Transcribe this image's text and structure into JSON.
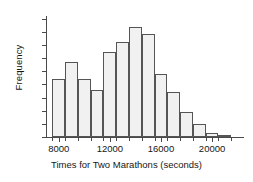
{
  "chart_data": {
    "type": "bar",
    "title": "",
    "xlabel": "Times for Two Marathons (seconds)",
    "ylabel": "Frequency",
    "xlim": [
      7000,
      22500
    ],
    "ylim": [
      0,
      92
    ],
    "bin_width": 1000,
    "bin_starts": [
      7500,
      8500,
      9500,
      10500,
      11500,
      12500,
      13500,
      14500,
      15500,
      16500,
      17500,
      18500,
      19500,
      20500
    ],
    "categories": [
      "7500-8500",
      "8500-9500",
      "9500-10500",
      "10500-11500",
      "11500-12500",
      "12500-13500",
      "13500-14500",
      "14500-15500",
      "15500-16500",
      "16500-17500",
      "17500-18500",
      "18500-19500",
      "19500-20500",
      "20500-21500"
    ],
    "values": [
      44,
      57,
      44,
      36,
      65,
      72,
      84,
      78,
      48,
      34,
      19,
      10,
      3,
      1
    ],
    "ytick_labels": [
      "0",
      "10",
      "20",
      "30",
      "40",
      "50",
      "60",
      "70",
      "80",
      "90"
    ],
    "ytick_values": [
      0,
      10,
      20,
      30,
      40,
      50,
      60,
      70,
      80,
      90
    ],
    "xtick_labels": [
      "8000",
      "12000",
      "16000",
      "20000"
    ],
    "xtick_values": [
      8000,
      12000,
      16000,
      20000
    ],
    "xtick_minor_values": [
      7500,
      8500,
      9500,
      10500,
      11500,
      12500,
      13500,
      14500,
      15500,
      16500,
      17500,
      18500,
      19500,
      20500,
      21500
    ],
    "grid": false,
    "legend": null,
    "bar_fill_color": "#f1f1f1",
    "bar_edge_color": "#555555",
    "axis_color": "#4a4a4a"
  }
}
